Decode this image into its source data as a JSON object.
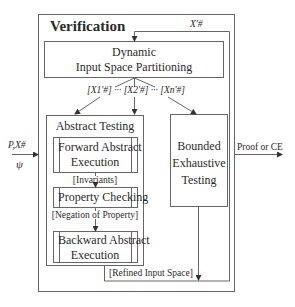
{
  "verification": {
    "title": "Verification"
  },
  "feedback": {
    "label": "X'#"
  },
  "dynamic": {
    "line1": "Dynamic",
    "line2": "Input Space Partitioning"
  },
  "partitions": {
    "label": "[X1'#] ··· [X2'#] ··· [Xn'#]"
  },
  "abstract_testing": {
    "title": "Abstract Testing",
    "forward": {
      "line1": "Forward Abstract",
      "line2": "Execution"
    },
    "invariants": "[Invariants]",
    "property": "Property Checking",
    "negation": "[Negation of Property]",
    "backward": {
      "line1": "Backward Abstract",
      "line2": "Execution"
    }
  },
  "bounded": {
    "line1": "Bounded",
    "line2": "Exhaustive",
    "line3": "Testing"
  },
  "refined": "[Refined Input Space]",
  "inputs": {
    "top": "P,X#",
    "bottom": "ψ"
  },
  "output": "Proof or CE",
  "colors": {
    "line": "#555555",
    "text": "#2a2a2a"
  }
}
